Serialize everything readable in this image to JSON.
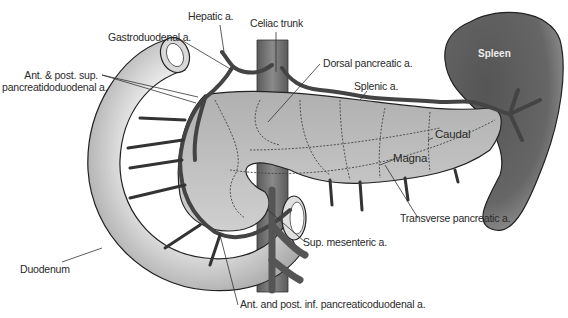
{
  "diagram": {
    "labels": {
      "hepatic": "Hepatic a.",
      "celiac": "Celiac trunk",
      "gastroduodenal": "Gastroduodenal a.",
      "sup_pd_line1": "Ant. & post. sup.",
      "sup_pd_line2": "pancreatidoduodenal a.",
      "dorsal": "Dorsal pancreatic a.",
      "splenic": "Splenic a.",
      "spleen": "Spleen",
      "caudal": "Caudal",
      "magna": "Magna",
      "transverse": "Transverse pancreatic a.",
      "sup_mesenteric": "Sup. mesenteric a.",
      "duodenum": "Duodenum",
      "inf_pd": "Ant. and post. inf. pancreaticoduodenal a."
    },
    "colors": {
      "pancreas": "#b9b9b9",
      "duodenum": "#e6e6e6",
      "artery": "#4a4a4a",
      "spleen": "#5e5e5e",
      "aorta": "#7a7a7a",
      "outline": "#222222"
    }
  }
}
